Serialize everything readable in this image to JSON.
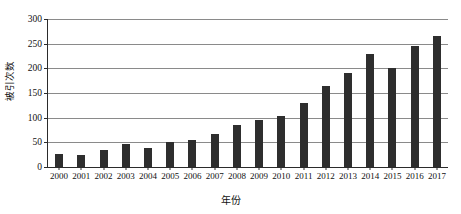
{
  "chart_data": {
    "type": "bar",
    "title": "",
    "xlabel": "年份",
    "ylabel": "被引次数",
    "categories": [
      "2000",
      "2001",
      "2002",
      "2003",
      "2004",
      "2005",
      "2006",
      "2007",
      "2008",
      "2009",
      "2010",
      "2011",
      "2012",
      "2013",
      "2014",
      "2015",
      "2016",
      "2017"
    ],
    "values": [
      27,
      25,
      34,
      46,
      39,
      50,
      54,
      67,
      85,
      95,
      103,
      130,
      165,
      190,
      230,
      200,
      245,
      265
    ],
    "ylim": [
      0,
      300
    ],
    "yticks": [
      0,
      50,
      100,
      150,
      200,
      250,
      300
    ],
    "ytick_labels": [
      "0",
      "50",
      "100",
      "150",
      "200",
      "250",
      "300"
    ],
    "grid": true,
    "legend": false,
    "bar_color": "#2e2e2e",
    "grid_color": "#8a8a8a",
    "axis_color": "#2b2b2b"
  }
}
